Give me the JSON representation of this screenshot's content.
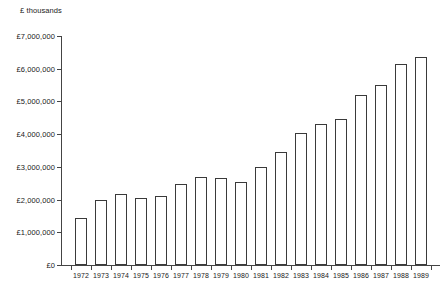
{
  "chart_data": {
    "type": "bar",
    "title": "",
    "subtitle": "",
    "unit_caption": "£ thousands",
    "xlabel": "",
    "ylabel": "",
    "grid": false,
    "legend": null,
    "ylim": [
      0,
      7000000
    ],
    "ytick_step": 1000000,
    "ytick_labels": [
      "£0",
      "£1,000,000",
      "£2,000,000",
      "£3,000,000",
      "£4,000,000",
      "£5,000,000",
      "£6,000,000",
      "£7,000,000"
    ],
    "ytick_values": [
      0,
      1000000,
      2000000,
      3000000,
      4000000,
      5000000,
      6000000,
      7000000
    ],
    "categories": [
      "1972",
      "1973",
      "1974",
      "1975",
      "1976",
      "1977",
      "1978",
      "1979",
      "1980",
      "1981",
      "1982",
      "1983",
      "1984",
      "1985",
      "1986",
      "1987",
      "1988",
      "1989"
    ],
    "values": [
      1450000,
      1980000,
      2180000,
      2050000,
      2100000,
      2480000,
      2700000,
      2650000,
      2550000,
      3000000,
      3450000,
      4050000,
      4300000,
      4450000,
      5200000,
      5500000,
      6150000,
      6350000
    ],
    "bar_style": {
      "fill": "#ffffff",
      "stroke": "#3a3a3a"
    }
  }
}
